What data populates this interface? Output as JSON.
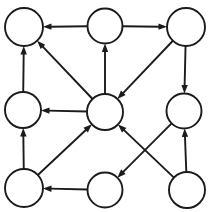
{
  "diagram": {
    "type": "directed-graph",
    "width": 221,
    "height": 212,
    "background_color": "#ffffff",
    "stroke_color": "#1b1b1b",
    "node_fill_color": "#ffffff",
    "stroke_width": 1.9,
    "show_node_labels": false,
    "node_count": 9,
    "edge_count": 11,
    "nodes": [
      {
        "id": "top-left",
        "label": "",
        "cx": 24,
        "cy": 27,
        "r": 19
      },
      {
        "id": "top-middle",
        "label": "",
        "cx": 105,
        "cy": 26,
        "r": 17.5
      },
      {
        "id": "top-right",
        "label": "",
        "cx": 186,
        "cy": 27,
        "r": 19
      },
      {
        "id": "middle-left",
        "label": "",
        "cx": 23,
        "cy": 110,
        "r": 18
      },
      {
        "id": "center",
        "label": "",
        "cx": 105,
        "cy": 112,
        "r": 18
      },
      {
        "id": "middle-right",
        "label": "",
        "cx": 184,
        "cy": 111,
        "r": 17.5
      },
      {
        "id": "bottom-left",
        "label": "",
        "cx": 24,
        "cy": 188,
        "r": 19
      },
      {
        "id": "bottom-middle",
        "label": "",
        "cx": 105,
        "cy": 190,
        "r": 17.5
      },
      {
        "id": "bottom-right",
        "label": "",
        "cx": 187,
        "cy": 190,
        "r": 18
      }
    ],
    "edges": [
      {
        "id": "edge-top-middle-to-top-left",
        "from": "top-middle",
        "to": "top-left",
        "label": "",
        "shape": "straight"
      },
      {
        "id": "edge-top-middle-to-top-right",
        "from": "top-middle",
        "to": "top-right",
        "label": "",
        "shape": "straight"
      },
      {
        "id": "edge-middle-left-to-top-left",
        "from": "middle-left",
        "to": "top-left",
        "label": "",
        "shape": "straight"
      },
      {
        "id": "edge-center-to-top-left",
        "from": "center",
        "to": "top-left",
        "label": "",
        "shape": "straight"
      },
      {
        "id": "edge-center-to-top-middle",
        "from": "center",
        "to": "top-middle",
        "label": "",
        "shape": "straight"
      },
      {
        "id": "edge-top-right-to-center",
        "from": "top-right",
        "to": "center",
        "label": "",
        "shape": "straight"
      },
      {
        "id": "edge-top-right-to-middle-right",
        "from": "top-right",
        "to": "middle-right",
        "label": "",
        "shape": "straight"
      },
      {
        "id": "edge-center-to-middle-left",
        "from": "center",
        "to": "middle-left",
        "label": "",
        "shape": "straight"
      },
      {
        "id": "edge-bottom-left-to-middle-left",
        "from": "bottom-left",
        "to": "middle-left",
        "label": "",
        "shape": "straight"
      },
      {
        "id": "edge-bottom-left-to-center",
        "from": "bottom-left",
        "to": "center",
        "label": "",
        "shape": "straight"
      },
      {
        "id": "edge-bottom-middle-to-bottom-left",
        "from": "bottom-middle",
        "to": "bottom-left",
        "label": "",
        "shape": "straight"
      },
      {
        "id": "edge-middle-right-to-bottom-middle",
        "from": "middle-right",
        "to": "bottom-middle",
        "label": "",
        "shape": "straight"
      },
      {
        "id": "edge-bottom-right-to-middle-right",
        "from": "bottom-right",
        "to": "middle-right",
        "label": "",
        "shape": "straight"
      },
      {
        "id": "edge-bottom-right-to-center",
        "from": "bottom-right",
        "to": "center",
        "label": "",
        "shape": "straight"
      }
    ],
    "arrowhead": {
      "length": 8.5,
      "half_width": 3.2
    }
  }
}
